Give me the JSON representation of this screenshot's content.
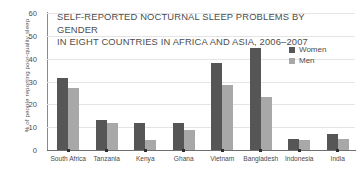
{
  "chart_data": {
    "type": "bar",
    "title": "SELF-REPORTED NOCTURNAL SLEEP PROBLEMS BY GENDER IN EIGHT COUNTRIES IN AFRICA AND ASIA, 2006–2007",
    "title_lines": [
      "SELF-REPORTED NOCTURNAL SLEEP PROBLEMS BY GENDER",
      "IN EIGHT COUNTRIES IN AFRICA AND ASIA, 2006–2007"
    ],
    "xlabel": "",
    "ylabel": "% of people reporting poor-quality sleep",
    "ylim": [
      0,
      60
    ],
    "yticks": [
      0,
      10,
      20,
      30,
      40,
      50,
      60
    ],
    "grid": true,
    "legend_position": "top-right",
    "categories": [
      "South Africa",
      "Tanzania",
      "Kenya",
      "Ghana",
      "Vietnam",
      "Bangladesh",
      "Indonesia",
      "India"
    ],
    "series": [
      {
        "name": "Women",
        "color": "#565656",
        "values": [
          31.5,
          13.2,
          11.7,
          12.0,
          38.0,
          44.5,
          5.0,
          7.0
        ]
      },
      {
        "name": "Men",
        "color": "#a8a8a8",
        "values": [
          27.2,
          11.9,
          4.2,
          8.9,
          28.6,
          23.4,
          4.2,
          4.8
        ]
      }
    ]
  },
  "legend": {
    "items": [
      {
        "label": "Women",
        "color": "#565656"
      },
      {
        "label": "Men",
        "color": "#a8a8a8"
      }
    ]
  },
  "colors": {
    "women": "#565656",
    "men": "#a8a8a8",
    "grid": "#e4e4e4",
    "axis": "#6e6e6e",
    "text": "#4a4a4a",
    "background": "#ffffff"
  }
}
